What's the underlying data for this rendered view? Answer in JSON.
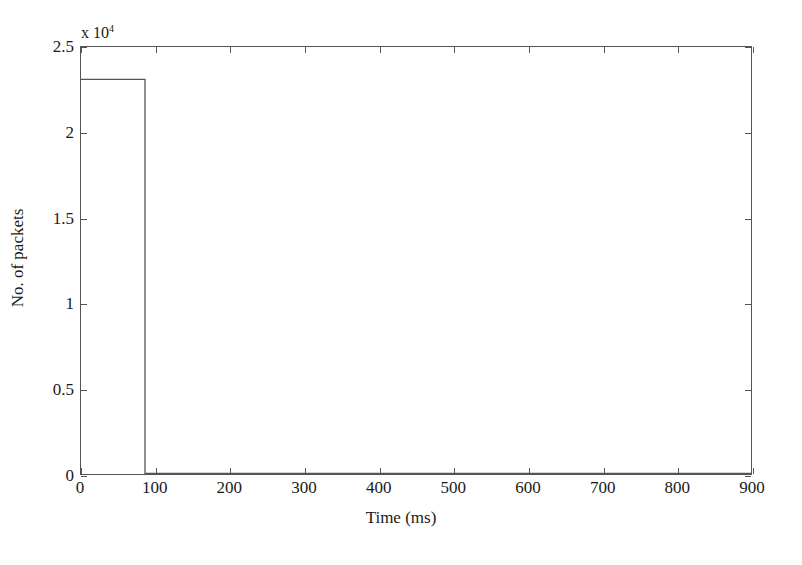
{
  "chart_data": {
    "type": "line",
    "title": "",
    "subtitle": "",
    "xlabel": "Time (ms)",
    "ylabel": "No. of packets",
    "y_multiplier_prefix": "x 10",
    "y_multiplier_exponent": "4",
    "y_multiplier_value": 10000,
    "xlim": [
      0,
      900
    ],
    "ylim": [
      0,
      25000
    ],
    "xticks": [
      0,
      100,
      200,
      300,
      400,
      500,
      600,
      700,
      800,
      900
    ],
    "xticklabels": [
      "0",
      "100",
      "200",
      "300",
      "400",
      "500",
      "600",
      "700",
      "800",
      "900"
    ],
    "yticks": [
      0,
      5000,
      10000,
      15000,
      20000,
      25000
    ],
    "yticklabels": [
      "0",
      "0.5",
      "1",
      "1.5",
      "2",
      "2.5"
    ],
    "grid": false,
    "box": true,
    "tick_direction": "in",
    "legend": null,
    "annotations": [],
    "series": [
      {
        "name": "packets",
        "color": "#555555",
        "linewidth": 1,
        "drawstyle": "steps-post",
        "x": [
          0,
          86,
          86,
          900
        ],
        "y": [
          23100,
          23100,
          40,
          30
        ],
        "points": [
          {
            "t": 0,
            "packets": 23100
          },
          {
            "t": 86,
            "packets": 23100
          },
          {
            "t": 86,
            "packets": 40
          },
          {
            "t": 200,
            "packets": 35
          },
          {
            "t": 400,
            "packets": 32
          },
          {
            "t": 600,
            "packets": 30
          },
          {
            "t": 900,
            "packets": 30
          }
        ]
      }
    ]
  },
  "figure": {
    "background_color": "#ffffff",
    "axis_color": "#555555",
    "text_color": "#1a1a1a"
  }
}
